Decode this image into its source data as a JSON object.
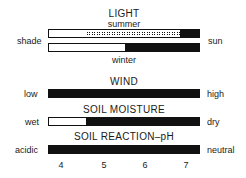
{
  "light": {
    "title": "LIGHT",
    "summer_label": "summer",
    "winter_label": "winter",
    "left": "shade",
    "right": "sun"
  },
  "wind": {
    "title": "WIND",
    "left": "low",
    "right": "high"
  },
  "soil_moisture": {
    "title": "SOIL MOISTURE",
    "left": "wet",
    "right": "dry"
  },
  "soil_ph": {
    "title": "SOIL REACTION–pH",
    "left": "acidic",
    "right": "neutral"
  },
  "scale_ticks": [
    "4",
    "5",
    "6",
    "7"
  ],
  "colors": {
    "fill": "#111111",
    "empty": "#ffffff"
  },
  "bars": {
    "light_summer": {
      "white_end": 0.24,
      "dotted_end": 0.86
    },
    "light_winter": {
      "white_end": 0.5
    },
    "wind": {
      "white_end": 0
    },
    "soil_moisture": {
      "white_end": 0.24
    },
    "soil_ph": {
      "white_end": 0
    }
  }
}
